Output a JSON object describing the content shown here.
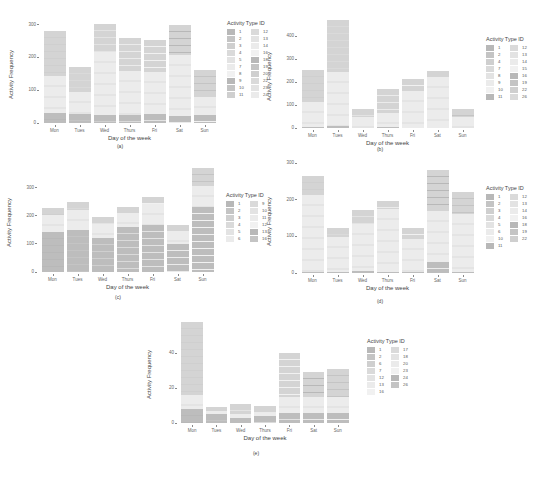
{
  "figure": {
    "colors": {
      "dark": "#bdbdbd",
      "mid": "#d4d4d4",
      "light": "#ececec",
      "axis_text": "#666666"
    }
  },
  "chart_data": [
    {
      "id": "a",
      "type": "bar",
      "stacked": true,
      "caption": "(a)",
      "xlabel": "Day of the week",
      "ylabel": "Activity Frequency",
      "categories": [
        "Mon",
        "Tues",
        "Wed",
        "Thurs",
        "Fri",
        "Sat",
        "Sun"
      ],
      "values": [
        280,
        172,
        302,
        258,
        252,
        300,
        162
      ],
      "segments": [
        {
          "bottom": 32,
          "middle": 110,
          "top": 138
        },
        {
          "bottom": 28,
          "middle": 65,
          "top": 79
        },
        {
          "bottom": 25,
          "middle": 190,
          "top": 87
        },
        {
          "bottom": 25,
          "middle": 135,
          "top": 98
        },
        {
          "bottom": 27,
          "middle": 128,
          "top": 97
        },
        {
          "bottom": 20,
          "middle": 188,
          "top": 92
        },
        {
          "bottom": 25,
          "middle": 55,
          "top": 82
        }
      ],
      "yticks": [
        0,
        100,
        200,
        300
      ],
      "ylim": [
        0,
        320
      ],
      "legend": {
        "title": "Activity Type ID",
        "col1": [
          "1",
          "2",
          "3",
          "4",
          "5",
          "7",
          "8",
          "9",
          "10",
          "11"
        ],
        "col2": [
          "12",
          "13",
          "14",
          "16",
          "18",
          "19",
          "20",
          "22",
          "23",
          "24"
        ]
      }
    },
    {
      "id": "b",
      "type": "bar",
      "stacked": true,
      "caption": "(b)",
      "xlabel": "Day of the week",
      "ylabel": "Activity Frequency",
      "categories": [
        "Mon",
        "Tues",
        "Wed",
        "Thurs",
        "Fri",
        "Sat",
        "Sun"
      ],
      "values": [
        252,
        470,
        85,
        170,
        215,
        250,
        85
      ],
      "segments": [
        {
          "bottom": 5,
          "middle": 110,
          "top": 137
        },
        {
          "bottom": 8,
          "middle": 235,
          "top": 227
        },
        {
          "bottom": 2,
          "middle": 48,
          "top": 35
        },
        {
          "bottom": 6,
          "middle": 60,
          "top": 104
        },
        {
          "bottom": 2,
          "middle": 160,
          "top": 53
        },
        {
          "bottom": 2,
          "middle": 222,
          "top": 26
        },
        {
          "bottom": 2,
          "middle": 45,
          "top": 38
        }
      ],
      "yticks": [
        0,
        100,
        200,
        300,
        400
      ],
      "ylim": [
        0,
        480
      ],
      "legend": {
        "title": "Activity Type ID",
        "col1": [
          "1",
          "2",
          "4",
          "7",
          "8",
          "9",
          "10",
          "11"
        ],
        "col2": [
          "12",
          "13",
          "14",
          "15",
          "16",
          "19",
          "22",
          "26"
        ]
      }
    },
    {
      "id": "c",
      "type": "bar",
      "stacked": true,
      "caption": "(c)",
      "xlabel": "Day of the week",
      "ylabel": "Activity Frequency",
      "categories": [
        "Mon",
        "Tues",
        "Wed",
        "Thurs",
        "Fri",
        "Sat",
        "Sun"
      ],
      "values": [
        228,
        250,
        195,
        232,
        265,
        168,
        370
      ],
      "segments": [
        {
          "bottom": 142,
          "middle": 62,
          "top": 24
        },
        {
          "bottom": 150,
          "middle": 72,
          "top": 28
        },
        {
          "bottom": 122,
          "middle": 50,
          "top": 23
        },
        {
          "bottom": 160,
          "middle": 48,
          "top": 24
        },
        {
          "bottom": 168,
          "middle": 75,
          "top": 22
        },
        {
          "bottom": 100,
          "middle": 45,
          "top": 23
        },
        {
          "bottom": 232,
          "middle": 73,
          "top": 65
        }
      ],
      "yticks": [
        0,
        100,
        200,
        300
      ],
      "ylim": [
        0,
        380
      ],
      "legend": {
        "title": "Activity Type ID",
        "col1": [
          "1",
          "2",
          "3",
          "4",
          "5",
          "6"
        ],
        "col2": [
          "9",
          "10",
          "11",
          "12",
          "13",
          "16"
        ]
      }
    },
    {
      "id": "d",
      "type": "bar",
      "stacked": true,
      "caption": "(d)",
      "xlabel": "Day of the week",
      "ylabel": "Activity Frequency",
      "categories": [
        "Mon",
        "Tues",
        "Wed",
        "Thurs",
        "Fri",
        "Sat",
        "Sun"
      ],
      "values": [
        265,
        122,
        172,
        197,
        122,
        282,
        222
      ],
      "segments": [
        {
          "bottom": 2,
          "middle": 210,
          "top": 53
        },
        {
          "bottom": 2,
          "middle": 96,
          "top": 24
        },
        {
          "bottom": 5,
          "middle": 128,
          "top": 39
        },
        {
          "bottom": 3,
          "middle": 172,
          "top": 22
        },
        {
          "bottom": 2,
          "middle": 90,
          "top": 30
        },
        {
          "bottom": 30,
          "middle": 140,
          "top": 112
        },
        {
          "bottom": 3,
          "middle": 158,
          "top": 61
        }
      ],
      "yticks": [
        0,
        100,
        200,
        300
      ],
      "ylim": [
        0,
        300
      ],
      "legend": {
        "title": "Activity Type ID",
        "col1": [
          "1",
          "2",
          "3",
          "4",
          "5",
          "6",
          "10",
          "11"
        ],
        "col2": [
          "12",
          "13",
          "14",
          "16",
          "18",
          "19",
          "22"
        ]
      }
    },
    {
      "id": "e",
      "type": "bar",
      "stacked": true,
      "caption": "(e)",
      "xlabel": "Day of the week",
      "ylabel": "Activity Frequency",
      "categories": [
        "Mon",
        "Tues",
        "Wed",
        "Thurs",
        "Fri",
        "Sat",
        "Sun"
      ],
      "values": [
        58,
        9,
        11,
        10,
        40,
        29,
        31
      ],
      "segments": [
        {
          "bottom": 8,
          "middle": 8,
          "top": 42
        },
        {
          "bottom": 5,
          "middle": 2,
          "top": 2
        },
        {
          "bottom": 3,
          "middle": 2,
          "top": 6
        },
        {
          "bottom": 4,
          "middle": 2,
          "top": 4
        },
        {
          "bottom": 6,
          "middle": 9,
          "top": 25
        },
        {
          "bottom": 6,
          "middle": 9,
          "top": 14
        },
        {
          "bottom": 6,
          "middle": 9,
          "top": 16
        }
      ],
      "yticks": [
        0,
        20,
        40
      ],
      "ylim": [
        0,
        60
      ],
      "legend": {
        "title": "Activity Type ID",
        "col1": [
          "1",
          "2",
          "6",
          "7",
          "12",
          "13",
          "16"
        ],
        "col2": [
          "17",
          "18",
          "20",
          "23",
          "24",
          "26"
        ]
      }
    }
  ],
  "layout": {
    "panels": [
      {
        "id": "a",
        "plot": {
          "x": 42,
          "y": 18,
          "w": 175,
          "h": 105
        },
        "legend": {
          "x": 227,
          "y": 20
        },
        "caption": {
          "x": 120,
          "y": 143
        }
      },
      {
        "id": "b",
        "plot": {
          "x": 300,
          "y": 18,
          "w": 175,
          "h": 110
        },
        "legend": {
          "x": 486,
          "y": 36
        },
        "caption": {
          "x": 380,
          "y": 146
        }
      },
      {
        "id": "c",
        "plot": {
          "x": 40,
          "y": 165,
          "w": 175,
          "h": 107
        },
        "legend": {
          "x": 226,
          "y": 192
        },
        "caption": {
          "x": 118,
          "y": 294
        }
      },
      {
        "id": "d",
        "plot": {
          "x": 300,
          "y": 163,
          "w": 175,
          "h": 110
        },
        "legend": {
          "x": 486,
          "y": 185
        },
        "caption": {
          "x": 380,
          "y": 298
        }
      },
      {
        "id": "e",
        "plot": {
          "x": 180,
          "y": 318,
          "w": 170,
          "h": 105
        },
        "legend": {
          "x": 367,
          "y": 338
        },
        "caption": {
          "x": 256,
          "y": 450
        }
      }
    ]
  }
}
